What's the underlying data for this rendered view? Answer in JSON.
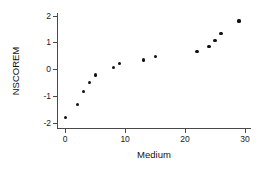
{
  "chart_data": {
    "type": "scatter",
    "title": "",
    "xlabel": "Medium",
    "ylabel": "NSCOREM",
    "xlim": [
      -1.2,
      31
    ],
    "ylim": [
      -2.2,
      2.1
    ],
    "xticks": [
      0,
      10,
      20,
      30
    ],
    "xticklabels": [
      "0",
      "10",
      "20",
      "30"
    ],
    "yticks": [
      -2,
      -1,
      0,
      1,
      2
    ],
    "yticklabels": [
      "-2",
      "-1",
      "0",
      "1",
      "2"
    ],
    "grid": false,
    "legend": null,
    "marker": "filled-circle",
    "marker_color": "#111111",
    "points": [
      {
        "x": 0,
        "y": -1.8
      },
      {
        "x": 2,
        "y": -1.32
      },
      {
        "x": 3,
        "y": -0.85
      },
      {
        "x": 4,
        "y": -0.49
      },
      {
        "x": 5,
        "y": -0.22
      },
      {
        "x": 8,
        "y": 0.07
      },
      {
        "x": 9,
        "y": 0.21
      },
      {
        "x": 13,
        "y": 0.34
      },
      {
        "x": 15,
        "y": 0.48
      },
      {
        "x": 22,
        "y": 0.66
      },
      {
        "x": 24,
        "y": 0.85
      },
      {
        "x": 25,
        "y": 1.06
      },
      {
        "x": 26,
        "y": 1.33
      },
      {
        "x": 29,
        "y": 1.8
      }
    ]
  },
  "axes": {
    "spine_color": "#4a4a4a",
    "background": "#ffffff"
  }
}
